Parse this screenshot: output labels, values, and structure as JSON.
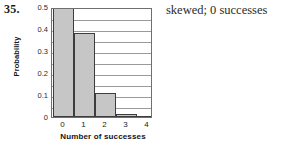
{
  "exercise": {
    "number": "35.",
    "answer": "skewed; 0 successes"
  },
  "chart_data": {
    "type": "bar",
    "title": "",
    "xlabel": "Number of successes",
    "ylabel": "Probability",
    "categories": [
      "0",
      "1",
      "2",
      "3",
      "4"
    ],
    "values": [
      0.5,
      0.38,
      0.11,
      0.015,
      0.0
    ],
    "ylim": [
      0,
      0.5
    ],
    "yticks": [
      "0.5",
      "0.4",
      "0.3",
      "0.2",
      "0.1",
      "0"
    ],
    "ytick_values": [
      0.5,
      0.4,
      0.3,
      0.2,
      0.1,
      0
    ],
    "gridlines": [
      0.05,
      0.1,
      0.15,
      0.2,
      0.25,
      0.3,
      0.35,
      0.4,
      0.45
    ],
    "grid": true,
    "legend": "none",
    "bar_fill_color": "#c6c6c6",
    "bar_edge_color": "#3d3d3d",
    "frame_color": "#6f6f6f",
    "grid_color": "#9a9a9a"
  }
}
